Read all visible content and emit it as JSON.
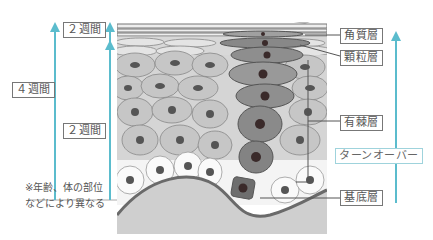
{
  "colors": {
    "arrow": "#5bbccd",
    "label_border": "#777777",
    "turnover_border": "#9fd3dc",
    "cell_light": "#c9c9c9",
    "cell_column": "#8a8a8a",
    "dermis": "#cfcfcf",
    "basement_line": "#6a6a6a"
  },
  "left_arrows": {
    "total": {
      "label": "４週間"
    },
    "upper": {
      "label": "２週間"
    },
    "lower": {
      "label": "２週間"
    }
  },
  "note": {
    "line1": "※年齢、体の部位",
    "line2": "などにより異なる"
  },
  "layers": [
    {
      "id": "stratum-corneum",
      "label": "角質層"
    },
    {
      "id": "stratum-granulosum",
      "label": "顆粒層"
    },
    {
      "id": "stratum-spinosum",
      "label": "有棘層"
    },
    {
      "id": "stratum-basale",
      "label": "基底層"
    }
  ],
  "turnover": {
    "label": "ターンオーバー"
  }
}
